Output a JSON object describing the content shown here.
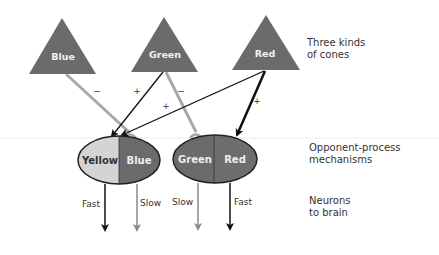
{
  "cones": {
    "label": "Three kinds\nof cones",
    "items": [
      {
        "name": "Blue",
        "color": "#6b6b6b"
      },
      {
        "name": "Green",
        "color": "#6b6b6b"
      },
      {
        "name": "Red",
        "color": "#6b6b6b"
      }
    ]
  },
  "connections": {
    "blue_to_blue": "−",
    "green_to_yellow": "+",
    "green_to_green": "−",
    "red_to_yellow": "+",
    "red_to_red": "+"
  },
  "mechanisms": {
    "label": "Opponent-process\nmechanisms",
    "pairs": [
      {
        "left": "Yellow",
        "right": "Blue",
        "left_color": "#d4d4d4",
        "right_color": "#6b6b6b"
      },
      {
        "left": "Green",
        "right": "Red",
        "left_color": "#6b6b6b",
        "right_color": "#6b6b6b"
      }
    ]
  },
  "neurons": {
    "label": "Neurons\nto brain",
    "outputs": [
      {
        "speed": "Fast",
        "color": "#111111"
      },
      {
        "speed": "Slow",
        "color": "#8a8a8a"
      },
      {
        "speed": "Slow",
        "color": "#8a8a8a"
      },
      {
        "speed": "Fast",
        "color": "#111111"
      }
    ]
  }
}
